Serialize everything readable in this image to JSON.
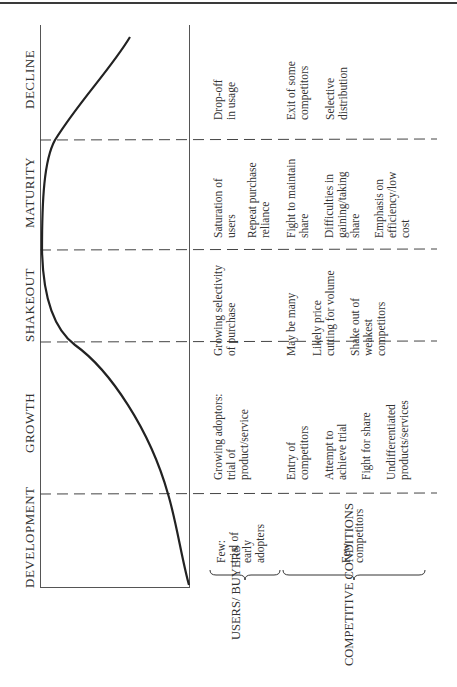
{
  "diagram": {
    "type": "product-life-cycle",
    "orientation": "rotated-90-ccw",
    "stages": [
      {
        "id": "development",
        "label": "DEVELOPMENT"
      },
      {
        "id": "growth",
        "label": "GROWTH"
      },
      {
        "id": "shakeout",
        "label": "SHAKEOUT"
      },
      {
        "id": "maturity",
        "label": "MATURITY"
      },
      {
        "id": "decline",
        "label": "DECLINE"
      }
    ],
    "categories": {
      "users_buyers": "USERS/ BUYERS",
      "competitive_conditions": "COMPETITIVE CONDITIONS"
    },
    "users_buyers": {
      "development": [
        "Few:",
        "trial of",
        "early",
        "adopters"
      ],
      "growth": [
        "Growing adoptors:",
        "trial of",
        "product/service"
      ],
      "shakeout": [
        "Growing selectivity",
        "of purchase"
      ],
      "maturity": [
        "Saturation of",
        "users",
        "Repeat purchase",
        "reliance"
      ],
      "decline": [
        "Drop-off",
        "in usage"
      ]
    },
    "competitive_conditions": {
      "development": [
        "Few",
        "competitors"
      ],
      "growth": [
        [
          "Entry of",
          "competitors"
        ],
        [
          "Attempt to",
          "achieve trial"
        ],
        [
          "Fight for share"
        ],
        [
          "Undifferentiated",
          "products/services"
        ]
      ],
      "shakeout": [
        [
          "May be many"
        ],
        [
          "Likely price",
          "cutting for volume"
        ],
        [
          "Shake out of",
          "weakest",
          "competitors"
        ]
      ],
      "maturity": [
        [
          "Fight to maintain",
          "share"
        ],
        [
          "Difficulties in",
          "gaining/taking",
          "share"
        ],
        [
          "Emphasis on",
          "efficiency/low",
          "cost"
        ]
      ],
      "decline": [
        [
          "Exit of some",
          "competitors"
        ],
        [
          "Selective",
          "distribution"
        ]
      ]
    }
  }
}
